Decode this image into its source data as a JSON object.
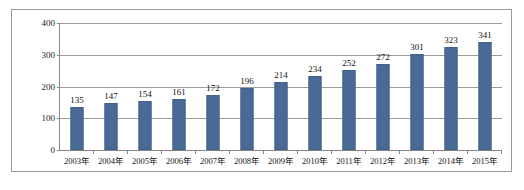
{
  "chart_data": {
    "type": "bar",
    "title": "",
    "xlabel": "",
    "ylabel": "",
    "categories": [
      "2003年",
      "2004年",
      "2005年",
      "2006年",
      "2007年",
      "2008年",
      "2009年",
      "2010年",
      "2011年",
      "2012年",
      "2013年",
      "2014年",
      "2015年"
    ],
    "values": [
      135,
      147,
      154,
      161,
      172,
      196,
      214,
      234,
      252,
      272,
      301,
      323,
      341
    ],
    "series": [
      {
        "name": "",
        "values": [
          135,
          147,
          154,
          161,
          172,
          196,
          214,
          234,
          252,
          272,
          301,
          323,
          341
        ]
      }
    ],
    "data_labels": [
      "135",
      "147",
      "154",
      "161",
      "172",
      "196",
      "214",
      "234",
      "252",
      "272",
      "301",
      "323",
      "341"
    ],
    "ylim": [
      0,
      400
    ],
    "yticks": [
      0,
      100,
      200,
      300,
      400
    ],
    "ytick_labels": [
      "0",
      "100",
      "200",
      "300",
      "400"
    ],
    "grid": true,
    "legend": false,
    "legend_position": "none",
    "colors": {
      "bar_fill": "#4a6a96",
      "bar_border": "#41608c",
      "gridline": "#9d9d9d",
      "axis": "#868686",
      "frame_border": "#9a9a9a",
      "plot_background": "#ffffff",
      "text": "#141414"
    }
  }
}
